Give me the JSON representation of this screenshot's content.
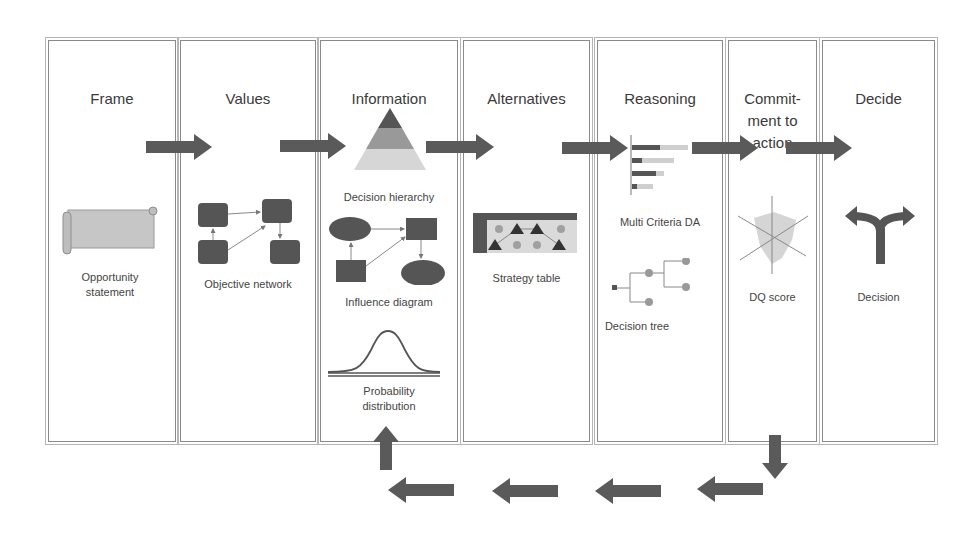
{
  "stages": [
    {
      "id": "frame",
      "title": "Frame"
    },
    {
      "id": "values",
      "title": "Values"
    },
    {
      "id": "information",
      "title": "Information"
    },
    {
      "id": "alternatives",
      "title": "Alternatives"
    },
    {
      "id": "reasoning",
      "title": "Reasoning"
    },
    {
      "id": "commitment",
      "title_lines": [
        "Commit-",
        "ment to",
        "action"
      ]
    },
    {
      "id": "decide",
      "title": "Decide"
    }
  ],
  "tools": {
    "opportunity_statement": [
      "Opportunity",
      "statement"
    ],
    "objective_network": "Objective network",
    "decision_hierarchy": "Decision hierarchy",
    "influence_diagram": "Influence diagram",
    "probability_distribution": [
      "Probability",
      "distribution"
    ],
    "strategy_table": "Strategy table",
    "multi_criteria_da": "Multi Criteria DA",
    "decision_tree": "Decision tree",
    "dq_score": "DQ score",
    "decision": "Decision"
  },
  "colors": {
    "arrow": "#5a5a5a",
    "dark": "#555555",
    "mid": "#8c8c8c",
    "light": "#cfcfcf",
    "border": "#8a8a8a"
  }
}
